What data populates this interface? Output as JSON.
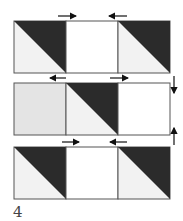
{
  "figure_label": "4",
  "colors": {
    "dark": "#2b2b2b",
    "light": "#f2f2f2",
    "medium": "#e4e4e4",
    "white": "#ffffff",
    "stroke": "#555555"
  },
  "rows": [
    {
      "blocks": [
        "hst-dark-topright",
        "plain-white",
        "hst-dark-topright"
      ],
      "arrows": "top: right, left"
    },
    {
      "blocks": [
        "plain-light",
        "hst-dark-topright",
        "plain-white"
      ],
      "arrows": "top: left, right; right side: down, up"
    },
    {
      "blocks": [
        "hst-dark-topright",
        "plain-white",
        "hst-dark-topright"
      ],
      "arrows": "top: right, left"
    }
  ]
}
